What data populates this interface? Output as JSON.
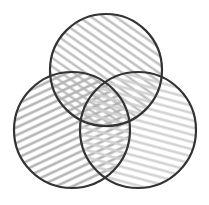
{
  "diagram": {
    "type": "venn",
    "sets": 3,
    "labels": [],
    "circles": [
      {
        "name": "top",
        "cx": 106,
        "cy": 70,
        "r": 56,
        "hatch": "diagonal-down-right"
      },
      {
        "name": "left",
        "cx": 72,
        "cy": 130,
        "r": 58,
        "hatch": "diagonal-up-right"
      },
      {
        "name": "right",
        "cx": 138,
        "cy": 130,
        "r": 58,
        "hatch": "horizontal-slight"
      }
    ],
    "colors": {
      "background": "#ffffff",
      "stroke": "#333333",
      "hatch": "#bdbdbd"
    }
  }
}
